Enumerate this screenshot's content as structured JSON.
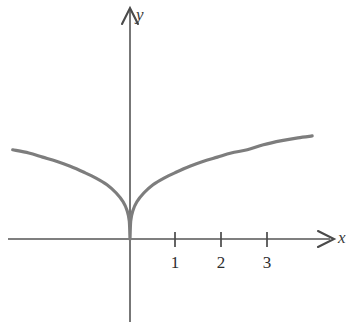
{
  "figure": {
    "width": 353,
    "height": 325,
    "background": "#ffffff"
  },
  "axes": {
    "x_label": "x",
    "y_label": "y",
    "x_axis": {
      "start_px": 8,
      "end_px": 332,
      "y_px": 239,
      "arrow": "right"
    },
    "y_axis": {
      "x_px": 130,
      "top_px": 8,
      "bottom_px": 322,
      "arrow": "up"
    },
    "axis_color": "#555555",
    "origin_px": {
      "x": 130,
      "y": 239
    },
    "pixels_per_unit": 46,
    "tick_labels": [
      "1",
      "2",
      "3"
    ],
    "tick_values": [
      1,
      2,
      3
    ],
    "tick_color": "#2e2e2e",
    "tick_length_px": 14
  },
  "chart_data": {
    "type": "line",
    "title": "",
    "xlabel": "x",
    "ylabel": "y",
    "grid": false,
    "legend": null,
    "curve_color": "#7d7d7d",
    "curve_width_px": 3.2,
    "xlim": [
      -2.55,
      3.96
    ],
    "ylim": [
      0,
      2.3
    ],
    "series": [
      {
        "name": "curve",
        "x": [
          -2.55,
          -2.2,
          -1.9,
          -1.6,
          -1.3,
          -1.0,
          -0.75,
          -0.5,
          -0.3,
          -0.15,
          -0.06,
          -0.015,
          0,
          0.015,
          0.06,
          0.15,
          0.3,
          0.5,
          0.75,
          1.0,
          1.3,
          1.6,
          1.9,
          2.2,
          2.55,
          2.9,
          3.3,
          3.65,
          3.96
        ],
        "y": [
          1.94,
          1.87,
          1.78,
          1.69,
          1.58,
          1.45,
          1.33,
          1.18,
          1.0,
          0.81,
          0.61,
          0.39,
          0.0,
          0.39,
          0.61,
          0.81,
          1.0,
          1.18,
          1.33,
          1.45,
          1.58,
          1.69,
          1.78,
          1.87,
          1.94,
          2.05,
          2.14,
          2.2,
          2.24
        ]
      }
    ],
    "ticks_x": [
      1,
      2,
      3
    ],
    "ticks_y": []
  }
}
